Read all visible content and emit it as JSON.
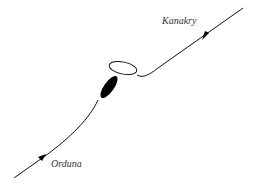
{
  "diagram": {
    "labels": {
      "top_right": "Kanakry",
      "bottom_left": "Orduna"
    },
    "colors": {
      "line": "#111111",
      "text": "#333333",
      "background": "#ffffff"
    }
  }
}
